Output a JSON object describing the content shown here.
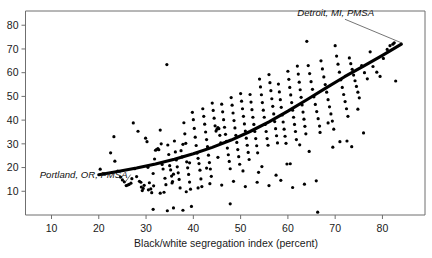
{
  "figure": {
    "partial_caption_top": "",
    "background_color": "#ffffff",
    "ink_color": "#000000"
  },
  "axes": {
    "x_title": "Black/white segregation index (percent)",
    "y_title": "",
    "x_ticks": [
      "10",
      "20",
      "30",
      "40",
      "50",
      "60",
      "70",
      "80"
    ],
    "y_ticks": [
      "10",
      "20",
      "30",
      "40",
      "50",
      "60",
      "70",
      "80"
    ]
  },
  "annotations": [
    {
      "name": "portland-label",
      "text": "Portland, OR, PMSA"
    },
    {
      "name": "detroit-label",
      "text": "Detroit, MI, PMSA"
    }
  ],
  "chart_data": {
    "type": "scatter",
    "title": "",
    "xlabel": "Black/white segregation index (percent)",
    "ylabel": "",
    "xlim": [
      4.5,
      89
    ],
    "ylim": [
      0,
      86
    ],
    "xticks": [
      10,
      20,
      30,
      40,
      50,
      60,
      70,
      80
    ],
    "yticks": [
      10,
      20,
      30,
      40,
      50,
      60,
      70,
      80
    ],
    "grid": false,
    "legend": "none",
    "marker": "filled-circle",
    "marker_size_px": 1.6,
    "annotations": [
      {
        "label": "Portland, OR, PMSA",
        "points_to_x": 25.5,
        "points_to_y": 13.5,
        "text_x": 7.5,
        "text_y": 15.8
      },
      {
        "label": "Detroit, MI, PMSA",
        "points_to_x": 84.0,
        "points_to_y": 72.0,
        "text_x": 62.0,
        "text_y": 84.0
      }
    ],
    "fit_curve": {
      "name": "fitted trend",
      "style": "solid-thick",
      "x_range": [
        20,
        84
      ],
      "points": [
        [
          20,
          17.0
        ],
        [
          24,
          18.3
        ],
        [
          28,
          19.8
        ],
        [
          32,
          21.5
        ],
        [
          36,
          23.5
        ],
        [
          40,
          25.8
        ],
        [
          44,
          28.5
        ],
        [
          48,
          31.6
        ],
        [
          52,
          35.2
        ],
        [
          56,
          39.3
        ],
        [
          60,
          43.8
        ],
        [
          64,
          48.6
        ],
        [
          68,
          53.5
        ],
        [
          72,
          58.3
        ],
        [
          76,
          62.8
        ],
        [
          80,
          67.3
        ],
        [
          84,
          72.0
        ]
      ]
    },
    "series": [
      {
        "name": "PMSA/MSA observations",
        "x": [
          20.3,
          22.5,
          23.2,
          23.4,
          24.0,
          24.6,
          25.0,
          25.4,
          25.8,
          26.1,
          26.4,
          26.8,
          27.0,
          27.3,
          27.6,
          28.0,
          28.3,
          28.6,
          28.9,
          29.2,
          29.4,
          29.6,
          29.9,
          30.2,
          30.4,
          30.7,
          31.0,
          31.2,
          31.5,
          31.6,
          31.8,
          32.0,
          32.2,
          32.5,
          32.7,
          33.0,
          33.2,
          33.4,
          33.6,
          33.8,
          34.0,
          34.2,
          34.4,
          34.6,
          34.8,
          35.0,
          35.2,
          35.4,
          35.6,
          35.8,
          36.0,
          36.2,
          36.4,
          36.6,
          36.8,
          37.0,
          37.2,
          37.4,
          37.6,
          37.8,
          38.0,
          38.2,
          38.4,
          38.6,
          38.8,
          39.0,
          39.2,
          39.4,
          39.6,
          39.8,
          40.0,
          40.2,
          40.4,
          40.6,
          40.8,
          41.0,
          41.2,
          41.4,
          41.6,
          41.8,
          42.0,
          42.2,
          42.4,
          42.6,
          42.8,
          43.0,
          43.2,
          43.4,
          43.6,
          43.8,
          44.0,
          44.2,
          44.4,
          44.6,
          44.8,
          45.0,
          45.2,
          45.4,
          45.6,
          45.8,
          46.0,
          46.2,
          46.4,
          46.6,
          46.8,
          47.0,
          47.2,
          47.4,
          47.6,
          47.8,
          48.0,
          48.2,
          48.4,
          48.6,
          48.8,
          49.0,
          49.2,
          49.4,
          49.6,
          49.8,
          50.0,
          50.2,
          50.4,
          50.6,
          50.8,
          51.0,
          51.2,
          51.4,
          51.6,
          51.8,
          52.0,
          52.2,
          52.4,
          52.6,
          52.8,
          53.0,
          53.2,
          53.4,
          53.6,
          53.8,
          54.0,
          54.2,
          54.4,
          54.6,
          54.8,
          55.0,
          55.2,
          55.4,
          55.6,
          55.8,
          56.0,
          56.2,
          56.4,
          56.6,
          56.8,
          57.0,
          57.2,
          57.4,
          57.6,
          57.8,
          58.0,
          58.2,
          58.4,
          58.6,
          58.8,
          59.0,
          59.2,
          59.4,
          59.6,
          59.8,
          60.0,
          60.2,
          60.4,
          60.6,
          60.8,
          61.0,
          61.2,
          61.4,
          61.6,
          61.8,
          62.0,
          62.2,
          62.4,
          62.6,
          62.8,
          63.0,
          63.2,
          63.4,
          63.6,
          63.8,
          64.0,
          64.3,
          64.6,
          64.9,
          65.2,
          65.5,
          65.8,
          66.1,
          66.4,
          66.7,
          67.0,
          67.3,
          67.6,
          67.9,
          68.2,
          68.5,
          68.8,
          69.1,
          69.4,
          69.7,
          70.0,
          70.3,
          70.6,
          70.9,
          71.2,
          71.5,
          71.8,
          72.1,
          72.4,
          72.7,
          73.0,
          73.3,
          73.6,
          73.9,
          74.2,
          74.5,
          74.8,
          75.1,
          75.6,
          76.2,
          76.8,
          77.4,
          78.0,
          78.8,
          79.5,
          80.2,
          81.0,
          81.6,
          82.2,
          82.8,
          31.5,
          34.5,
          37.8,
          47.8,
          66.3,
          29.0,
          30.5,
          33.0,
          35.5,
          38.5,
          41.0,
          43.5,
          46.0,
          48.5,
          51.0,
          53.5,
          56.0,
          58.5,
          61.0,
          63.5,
          66.0,
          68.5,
          71.0,
          73.5,
          76.0,
          35.8,
          39.2,
          42.8,
          45.2,
          50.5,
          54.5,
          57.5,
          60.5,
          62.5,
          64.5,
          66.8,
          69.5,
          72.5,
          74.8,
          82.5
        ],
        "y": [
          19.3,
          26.2,
          33.0,
          22.7,
          18.5,
          16.0,
          14.8,
          14.0,
          12.4,
          12.6,
          12.9,
          13.4,
          15.3,
          38.8,
          19.5,
          16.2,
          35.3,
          14.2,
          13.8,
          10.3,
          11.2,
          12.5,
          32.4,
          30.9,
          20.1,
          13.6,
          11.0,
          9.4,
          17.5,
          12.3,
          23.6,
          27.3,
          27.6,
          28.0,
          27.5,
          35.8,
          30.0,
          21.3,
          19.4,
          9.6,
          15.5,
          12.8,
          63.4,
          29.5,
          25.5,
          20.8,
          19.0,
          16.4,
          14.1,
          3.0,
          31.2,
          26.6,
          23.2,
          20.3,
          17.8,
          15.0,
          11.4,
          27.1,
          24.5,
          29.8,
          38.9,
          34.2,
          30.2,
          22.4,
          19.9,
          17.1,
          13.9,
          10.9,
          3.6,
          43.3,
          40.2,
          36.5,
          32.8,
          29.3,
          26.1,
          23.9,
          21.7,
          18.9,
          15.2,
          12.0,
          44.8,
          41.6,
          38.3,
          35.0,
          31.8,
          28.8,
          25.2,
          22.1,
          19.4,
          16.3,
          47.2,
          44.1,
          40.8,
          37.6,
          35.4,
          36.2,
          36.8,
          36.4,
          33.6,
          30.4,
          46.7,
          43.5,
          40.2,
          37.0,
          34.0,
          31.0,
          28.2,
          25.4,
          22.6,
          19.5,
          49.5,
          46.3,
          43.0,
          39.8,
          36.7,
          33.6,
          30.6,
          27.6,
          24.6,
          21.4,
          51.2,
          48.0,
          44.8,
          41.6,
          38.4,
          35.4,
          32.4,
          29.4,
          26.4,
          23.4,
          50.8,
          47.6,
          44.4,
          41.2,
          38.2,
          35.2,
          32.2,
          29.2,
          26.2,
          18.0,
          57.3,
          54.0,
          50.7,
          47.4,
          44.2,
          41.2,
          38.2,
          35.2,
          32.2,
          29.4,
          59.2,
          55.8,
          52.4,
          49.0,
          45.8,
          42.6,
          39.4,
          36.4,
          33.4,
          30.4,
          55.2,
          51.9,
          48.6,
          45.4,
          42.2,
          39.2,
          36.2,
          33.2,
          30.2,
          21.5,
          60.6,
          57.2,
          53.8,
          50.6,
          47.4,
          44.2,
          41.2,
          38.2,
          35.2,
          31.8,
          62.8,
          59.4,
          56.0,
          52.8,
          49.6,
          46.4,
          43.4,
          40.4,
          37.4,
          34.2,
          73.2,
          63.0,
          59.6,
          56.2,
          53.0,
          49.8,
          46.6,
          43.6,
          40.6,
          37.5,
          65.0,
          61.6,
          58.2,
          55.0,
          51.8,
          48.6,
          45.6,
          42.6,
          39.6,
          36.2,
          71.4,
          67.0,
          63.6,
          60.2,
          57.0,
          53.8,
          50.8,
          47.8,
          44.8,
          41.6,
          66.2,
          63.8,
          61.4,
          59.0,
          56.6,
          54.2,
          51.8,
          49.4,
          63.0,
          60.0,
          57.4,
          68.8,
          62.6,
          60.2,
          58.4,
          66.0,
          69.8,
          71.4,
          72.0,
          56.5,
          2.4,
          1.8,
          2.0,
          4.7,
          1.2,
          11.8,
          10.6,
          9.2,
          13.5,
          9.8,
          11.4,
          13.2,
          12.6,
          14.2,
          12.0,
          13.8,
          12.4,
          14.6,
          11.6,
          13.0,
          14.4,
          38.8,
          30.9,
          28.8,
          34.6,
          17.2,
          22.0,
          19.8,
          24.3,
          18.6,
          20.4,
          16.8,
          21.6,
          29.6,
          26.8,
          34.8,
          28.6,
          31.2,
          44.6,
          72.6
        ]
      }
    ]
  }
}
